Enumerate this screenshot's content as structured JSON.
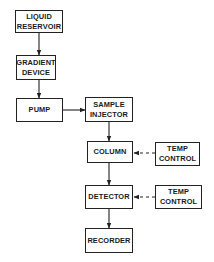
{
  "diagram": {
    "type": "flowchart",
    "title": "",
    "nodes": [
      {
        "id": "liquid_reservoir",
        "lines": [
          "LIQUID",
          "RESERVOIR"
        ]
      },
      {
        "id": "gradient_device",
        "lines": [
          "GRADIENT",
          "DEVICE"
        ]
      },
      {
        "id": "pump",
        "lines": [
          "PUMP"
        ]
      },
      {
        "id": "sample_injector",
        "lines": [
          "SAMPLE",
          "INJECTOR"
        ]
      },
      {
        "id": "column",
        "lines": [
          "COLUMN"
        ]
      },
      {
        "id": "temp_control_column",
        "lines": [
          "TEMP",
          "CONTROL"
        ]
      },
      {
        "id": "detector",
        "lines": [
          "DETECTOR"
        ]
      },
      {
        "id": "temp_control_detector",
        "lines": [
          "TEMP",
          "CONTROL"
        ]
      },
      {
        "id": "recorder",
        "lines": [
          "RECORDER"
        ]
      }
    ],
    "edges": [
      {
        "from": "liquid_reservoir",
        "to": "gradient_device",
        "style": "solid"
      },
      {
        "from": "gradient_device",
        "to": "pump",
        "style": "solid"
      },
      {
        "from": "pump",
        "to": "sample_injector",
        "style": "solid"
      },
      {
        "from": "sample_injector",
        "to": "column",
        "style": "solid"
      },
      {
        "from": "temp_control_column",
        "to": "column",
        "style": "dashed"
      },
      {
        "from": "column",
        "to": "detector",
        "style": "solid"
      },
      {
        "from": "temp_control_detector",
        "to": "detector",
        "style": "dashed"
      },
      {
        "from": "detector",
        "to": "recorder",
        "style": "solid"
      }
    ]
  }
}
